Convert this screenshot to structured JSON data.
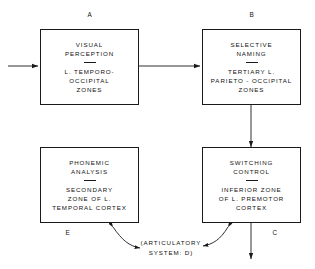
{
  "diagram": {
    "type": "block-flow-diagram",
    "background_color": "#ffffff",
    "line_color": "#1a1a1a",
    "nodes": [
      {
        "key": "A",
        "letter": "A",
        "letter_position": "above",
        "title": "VISUAL\nPERCEPTION",
        "detail": "L. TEMPORO-\nOCCIPITAL\nZONES"
      },
      {
        "key": "B",
        "letter": "B",
        "letter_position": "above",
        "title": "SELECTIVE\nNAMING",
        "detail": "TERTIARY L.\nPARIETO - OCCIPITAL\nZONES"
      },
      {
        "key": "E",
        "letter": "E",
        "letter_position": "below",
        "title": "PHONEMIC\nANALYSIS",
        "detail": "SECONDARY\nZONE OF L.\nTEMPORAL CORTEX"
      },
      {
        "key": "C",
        "letter": "C",
        "letter_position": "below",
        "title": "SWITCHING\nCONTROL",
        "detail": "INFERIOR ZONE\nOF L. PREMOTOR\nCORTEX"
      }
    ],
    "center_label": "(ARTICULATORY\nSYSTEM: D)",
    "connectors": [
      {
        "name": "input-arrow-to-a",
        "from": "external",
        "to": "A",
        "style": "straight",
        "direction": "right"
      },
      {
        "name": "arrow-a-to-b",
        "from": "A",
        "to": "B",
        "style": "straight",
        "direction": "right"
      },
      {
        "name": "arrow-b-to-c",
        "from": "B",
        "to": "C",
        "style": "straight",
        "direction": "down"
      },
      {
        "name": "arrow-c-output",
        "from": "C",
        "to": "external",
        "style": "straight",
        "direction": "down"
      },
      {
        "name": "curved-arrow-e-to-d",
        "from": "E",
        "to": "center_label",
        "style": "curved",
        "direction": "bidirectional"
      },
      {
        "name": "curved-arrow-c-to-d",
        "from": "C",
        "to": "center_label",
        "style": "curved",
        "direction": "bidirectional"
      }
    ]
  }
}
